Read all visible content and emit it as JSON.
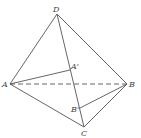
{
  "diagram": {
    "type": "tetrahedron",
    "points": {
      "D": {
        "label": "D",
        "x": 57,
        "y": 14
      },
      "A": {
        "label": "A",
        "x": 10,
        "y": 84
      },
      "B": {
        "label": "B",
        "x": 127,
        "y": 84
      },
      "C": {
        "label": "C",
        "x": 84,
        "y": 127
      },
      "A1": {
        "label": "A'",
        "x": 70,
        "y": 70
      },
      "B1": {
        "label": "B'",
        "x": 80,
        "y": 108
      }
    },
    "edges": [
      {
        "from": "D",
        "to": "A",
        "style": "solid"
      },
      {
        "from": "D",
        "to": "B",
        "style": "solid"
      },
      {
        "from": "D",
        "to": "C",
        "style": "solid"
      },
      {
        "from": "A",
        "to": "C",
        "style": "solid"
      },
      {
        "from": "B",
        "to": "C",
        "style": "solid"
      },
      {
        "from": "A",
        "to": "B",
        "style": "dashed"
      },
      {
        "from": "A",
        "to": "A1",
        "style": "solid"
      },
      {
        "from": "B",
        "to": "B1",
        "style": "solid"
      }
    ]
  }
}
